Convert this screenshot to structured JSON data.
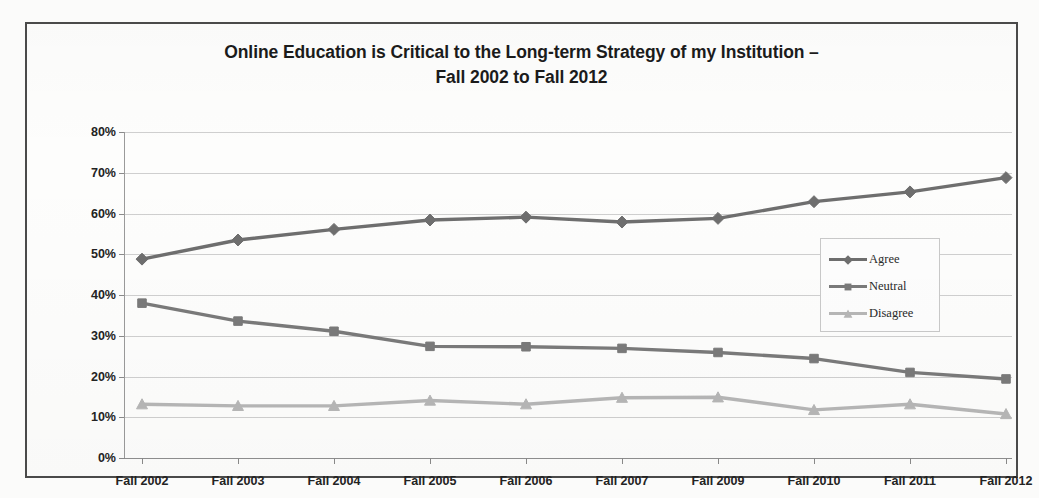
{
  "chart_data": {
    "type": "line",
    "title": "Online Education is Critical to the Long-term Strategy of my Institution – Fall 2002 to Fall 2012",
    "title_line1": "Online Education is Critical to the Long-term Strategy of my Institution –",
    "title_line2": "Fall 2002 to Fall 2012",
    "xlabel": "",
    "ylabel": "",
    "ylim": [
      0,
      80
    ],
    "ytick_labels": [
      "0%",
      "10%",
      "20%",
      "30%",
      "40%",
      "50%",
      "60%",
      "70%",
      "80%"
    ],
    "ytick_values": [
      0,
      10,
      20,
      30,
      40,
      50,
      60,
      70,
      80
    ],
    "grid": true,
    "legend_position": "right-inside",
    "categories": [
      "Fall 2002",
      "Fall 2003",
      "Fall 2004",
      "Fall 2005",
      "Fall 2006",
      "Fall 2007",
      "Fall 2009",
      "Fall 2010",
      "Fall 2011",
      "Fall 2012"
    ],
    "series": [
      {
        "name": "Agree",
        "marker": "diamond",
        "color": "#6e6e6e",
        "values": [
          48.8,
          53.5,
          56.1,
          58.4,
          59.1,
          57.9,
          58.8,
          62.9,
          65.3,
          68.8
        ]
      },
      {
        "name": "Neutral",
        "marker": "square",
        "color": "#7a7a7a",
        "values": [
          38.0,
          33.6,
          31.1,
          27.4,
          27.3,
          26.9,
          25.9,
          24.4,
          21.0,
          19.4
        ]
      },
      {
        "name": "Disagree",
        "marker": "triangle",
        "color": "#b6b6b6",
        "values": [
          13.2,
          12.8,
          12.8,
          14.1,
          13.2,
          14.8,
          14.9,
          11.8,
          13.2,
          10.8
        ]
      }
    ]
  },
  "legend": {
    "items": [
      {
        "label": "Agree",
        "color": "#6e6e6e",
        "marker": "diamond"
      },
      {
        "label": "Neutral",
        "color": "#7a7a7a",
        "marker": "square"
      },
      {
        "label": "Disagree",
        "color": "#b6b6b6",
        "marker": "triangle"
      }
    ]
  },
  "colors": {
    "agree": "#6e6e6e",
    "neutral": "#7a7a7a",
    "disagree": "#b6b6b6",
    "grid": "#cfcfcf",
    "axis": "#8f8f8f",
    "frame": "#4a4a4a",
    "text": "#232323",
    "background": "#fdfdfc"
  }
}
